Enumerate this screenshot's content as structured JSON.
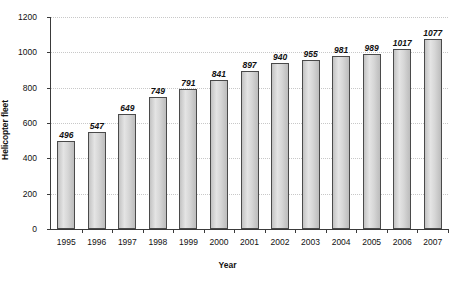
{
  "chart_data": {
    "type": "bar",
    "title": "",
    "xlabel": "Year",
    "ylabel": "Helicopter fleet",
    "categories": [
      "1995",
      "1996",
      "1997",
      "1998",
      "1999",
      "2000",
      "2001",
      "2002",
      "2003",
      "2004",
      "2005",
      "2006",
      "2007"
    ],
    "values": [
      496,
      547,
      649,
      749,
      791,
      841,
      897,
      940,
      955,
      981,
      989,
      1017,
      1077
    ],
    "value_labels": [
      "496",
      "547",
      "649",
      "749",
      "791",
      "841",
      "897",
      "940",
      "955",
      "981",
      "989",
      "1017",
      "1077"
    ],
    "ylim": [
      0,
      1200
    ],
    "ytick_values": [
      0,
      200,
      400,
      600,
      800,
      1000,
      1200
    ],
    "ytick_labels": [
      "0",
      "200",
      "400",
      "600",
      "800",
      "1000",
      "1200"
    ],
    "grid": "horizontal-dotted",
    "legend": "none",
    "bar_color": "#d6d6d6",
    "bar_border_color": "#4a4a4a",
    "gridline_color": "#c8c8c8",
    "axis_color": "#3a3a3a",
    "text_color": "#111111"
  },
  "caption": ""
}
